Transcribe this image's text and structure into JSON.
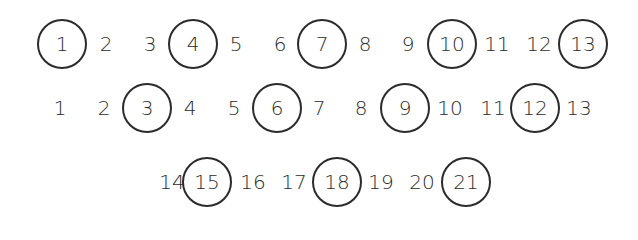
{
  "diagram": {
    "title": "",
    "colors": {
      "stroke": "#2b2b2b",
      "text": "#2b2b2b",
      "background": "#ffffff"
    },
    "rows": [
      {
        "y": 44,
        "items": [
          {
            "label": "1",
            "x": 62,
            "circled": true
          },
          {
            "label": "2",
            "x": 106,
            "circled": false
          },
          {
            "label": "3",
            "x": 150,
            "circled": false
          },
          {
            "label": "4",
            "x": 193,
            "circled": true
          },
          {
            "label": "5",
            "x": 236,
            "circled": false
          },
          {
            "label": "6",
            "x": 280,
            "circled": false
          },
          {
            "label": "7",
            "x": 322,
            "circled": true
          },
          {
            "label": "8",
            "x": 365,
            "circled": false
          },
          {
            "label": "9",
            "x": 408,
            "circled": false
          },
          {
            "label": "10",
            "x": 452,
            "circled": true
          },
          {
            "label": "11",
            "x": 497,
            "circled": false
          },
          {
            "label": "12",
            "x": 539,
            "circled": false
          },
          {
            "label": "13",
            "x": 583,
            "circled": true
          }
        ]
      },
      {
        "y": 108,
        "items": [
          {
            "label": "1",
            "x": 60,
            "circled": false
          },
          {
            "label": "2",
            "x": 104,
            "circled": false
          },
          {
            "label": "3",
            "x": 147,
            "circled": true
          },
          {
            "label": "4",
            "x": 190,
            "circled": false
          },
          {
            "label": "5",
            "x": 234,
            "circled": false
          },
          {
            "label": "6",
            "x": 277,
            "circled": true
          },
          {
            "label": "7",
            "x": 319,
            "circled": false
          },
          {
            "label": "8",
            "x": 361,
            "circled": false
          },
          {
            "label": "9",
            "x": 405,
            "circled": true
          },
          {
            "label": "10",
            "x": 450,
            "circled": false
          },
          {
            "label": "11",
            "x": 493,
            "circled": false
          },
          {
            "label": "12",
            "x": 535,
            "circled": true
          },
          {
            "label": "13",
            "x": 579,
            "circled": false
          }
        ]
      },
      {
        "y": 182,
        "items": [
          {
            "label": "14",
            "x": 172,
            "circled": false
          },
          {
            "label": "15",
            "x": 207,
            "circled": true
          },
          {
            "label": "16",
            "x": 253,
            "circled": false
          },
          {
            "label": "17",
            "x": 294,
            "circled": false
          },
          {
            "label": "18",
            "x": 337,
            "circled": true
          },
          {
            "label": "19",
            "x": 381,
            "circled": false
          },
          {
            "label": "20",
            "x": 422,
            "circled": false
          },
          {
            "label": "21",
            "x": 466,
            "circled": true
          }
        ]
      }
    ]
  }
}
